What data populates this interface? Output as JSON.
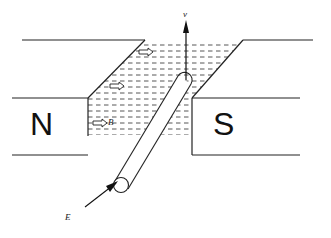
{
  "diagram": {
    "poles": {
      "north": "N",
      "south": "S"
    },
    "labels": {
      "velocity": "v",
      "field": "B",
      "emf": "E"
    },
    "colors": {
      "line": "#222222",
      "hatch": "#555555",
      "background": "#ffffff"
    }
  }
}
